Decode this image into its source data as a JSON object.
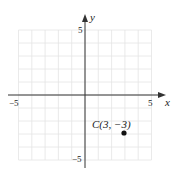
{
  "chart_data": {
    "type": "scatter",
    "title": "",
    "xlabel": "x",
    "ylabel": "y",
    "xlim": [
      -5,
      5
    ],
    "ylim": [
      -5,
      5
    ],
    "grid": true,
    "x_ticks_labeled": [
      "-5",
      "5"
    ],
    "y_ticks_labeled": [
      "5",
      "-5"
    ],
    "points": [
      {
        "label": "C(3, −3)",
        "x": 3,
        "y": -3
      }
    ]
  },
  "axes": {
    "x_label": "x",
    "y_label": "y",
    "x_min_label": "−5",
    "x_max_label": "5",
    "y_max_label": "5",
    "y_min_label": "−5"
  },
  "point": {
    "label": "C(3, −3)"
  },
  "colors": {
    "grid": "#e4e4e4",
    "axis": "#333333",
    "point": "#111111"
  }
}
